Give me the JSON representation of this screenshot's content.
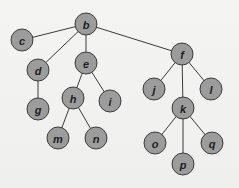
{
  "diagram": {
    "type": "tree",
    "root": "b",
    "node_radius": 11,
    "colors": {
      "background": "#f1f1f0",
      "node_fill": "#9c9c9c",
      "node_stroke": "#3c3c3c",
      "edge": "#3a3a3a",
      "label": "#1e1e1e"
    },
    "nodes": [
      {
        "id": "b",
        "label": "b",
        "x": 86,
        "y": 24
      },
      {
        "id": "c",
        "label": "c",
        "x": 22,
        "y": 40
      },
      {
        "id": "d",
        "label": "d",
        "x": 38,
        "y": 70
      },
      {
        "id": "e",
        "label": "e",
        "x": 86,
        "y": 63
      },
      {
        "id": "f",
        "label": "f",
        "x": 182,
        "y": 54
      },
      {
        "id": "g",
        "label": "g",
        "x": 38,
        "y": 109
      },
      {
        "id": "h",
        "label": "h",
        "x": 73,
        "y": 98
      },
      {
        "id": "i",
        "label": "i",
        "x": 110,
        "y": 101
      },
      {
        "id": "j",
        "label": "j",
        "x": 154,
        "y": 89
      },
      {
        "id": "k",
        "label": "k",
        "x": 183,
        "y": 108
      },
      {
        "id": "l",
        "label": "l",
        "x": 211,
        "y": 89
      },
      {
        "id": "m",
        "label": "m",
        "x": 58,
        "y": 138
      },
      {
        "id": "n",
        "label": "n",
        "x": 96,
        "y": 138
      },
      {
        "id": "o",
        "label": "o",
        "x": 155,
        "y": 143
      },
      {
        "id": "p",
        "label": "p",
        "x": 183,
        "y": 164
      },
      {
        "id": "q",
        "label": "q",
        "x": 212,
        "y": 143
      }
    ],
    "edges": [
      {
        "from": "b",
        "to": "c"
      },
      {
        "from": "b",
        "to": "d"
      },
      {
        "from": "b",
        "to": "e"
      },
      {
        "from": "b",
        "to": "f"
      },
      {
        "from": "d",
        "to": "g"
      },
      {
        "from": "e",
        "to": "h"
      },
      {
        "from": "e",
        "to": "i"
      },
      {
        "from": "h",
        "to": "m"
      },
      {
        "from": "h",
        "to": "n"
      },
      {
        "from": "f",
        "to": "j"
      },
      {
        "from": "f",
        "to": "k"
      },
      {
        "from": "f",
        "to": "l"
      },
      {
        "from": "k",
        "to": "o"
      },
      {
        "from": "k",
        "to": "p"
      },
      {
        "from": "k",
        "to": "q"
      }
    ]
  }
}
